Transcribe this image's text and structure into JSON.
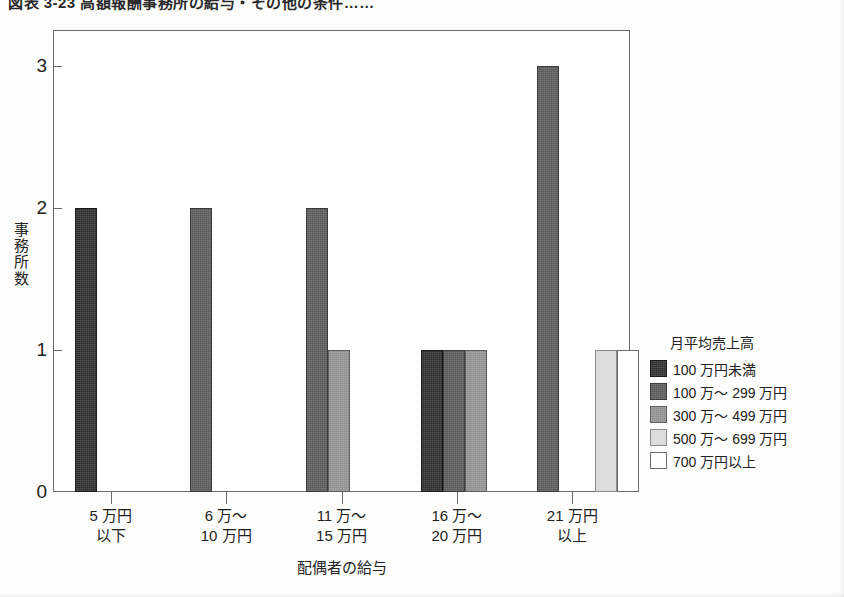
{
  "title": "図表 3-23  高額報酬事務所の給与・その他の条件……",
  "chart_data": {
    "type": "bar",
    "title": "図表 3-23  高額報酬事務所の給与・その他の条件……",
    "xlabel": "配偶者の給与",
    "ylabel": "事務所数",
    "ylim": [
      0,
      3.25
    ],
    "yticks": [
      0,
      1,
      2,
      3
    ],
    "ytick_labels": [
      "0",
      "1",
      "2",
      "3"
    ],
    "grid": false,
    "legend_position": "right",
    "legend_title": "月平均売上高",
    "categories": [
      {
        "line1": "5 万円",
        "line2": "以下"
      },
      {
        "line1": "6 万～",
        "line2": "10 万円"
      },
      {
        "line1": "11 万～",
        "line2": "15 万円"
      },
      {
        "line1": "16 万～",
        "line2": "20 万円"
      },
      {
        "line1": "21 万円",
        "line2": "以上"
      }
    ],
    "series": [
      {
        "name": "100 万円未満",
        "color": "#2b2b2b",
        "values": [
          2,
          0,
          0,
          1,
          0
        ]
      },
      {
        "name": "100 万～ 299 万円",
        "color": "#585858",
        "values": [
          0,
          2,
          2,
          1,
          3
        ]
      },
      {
        "name": "300 万～ 499 万円",
        "color": "#8f8f8f",
        "values": [
          0,
          0,
          1,
          1,
          0
        ]
      },
      {
        "name": "500 万～ 699 万円",
        "color": "#d9d9d9",
        "values": [
          0,
          0,
          0,
          0,
          1
        ]
      },
      {
        "name": "700 万円以上",
        "color": "#ffffff",
        "values": [
          0,
          0,
          0,
          0,
          1
        ]
      }
    ]
  }
}
